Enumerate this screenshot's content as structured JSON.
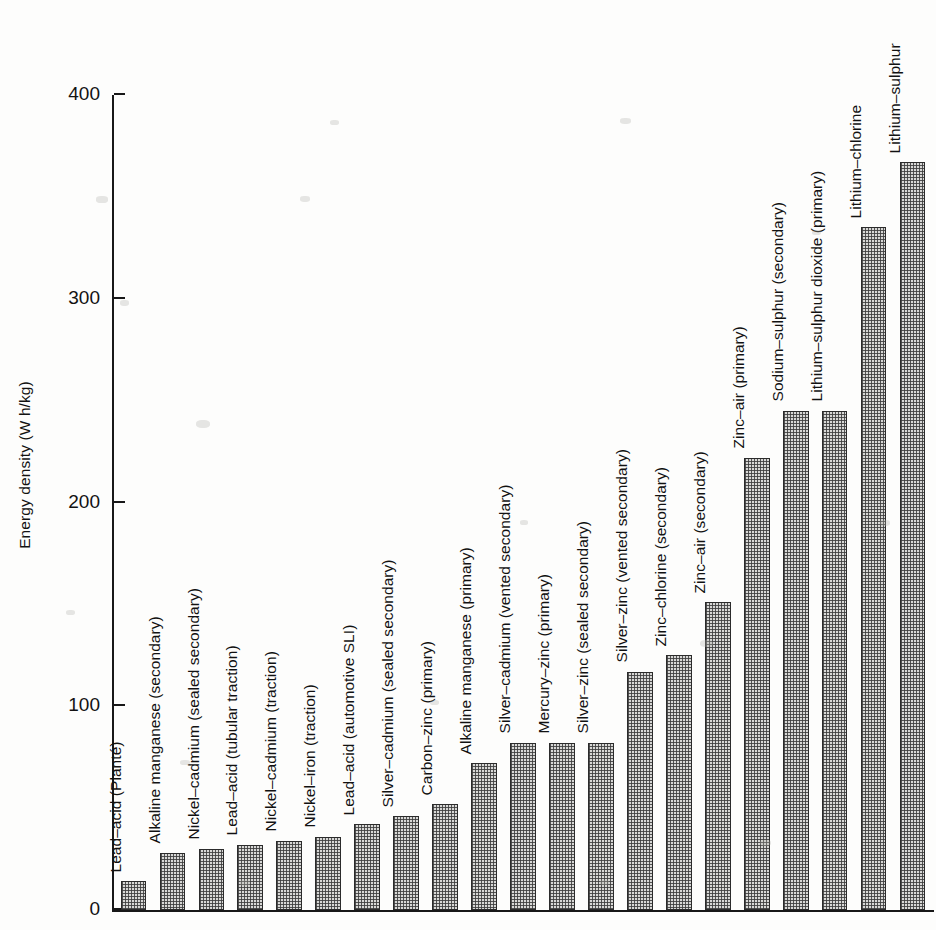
{
  "chart_data": {
    "type": "bar",
    "title": "",
    "xlabel": "",
    "ylabel": "Energy density (W h/kg)",
    "ylim": [
      0,
      400
    ],
    "yticks": [
      0,
      100,
      200,
      300,
      400
    ],
    "ytick_labels": [
      "0",
      "100",
      "200",
      "300",
      "400"
    ],
    "grid": false,
    "legend": "none",
    "categories": [
      "Lead–acid (Planté)",
      "Alkaline manganese (secondary)",
      "Nickel–cadmium (sealed secondary)",
      "Lead–acid (tubular traction)",
      "Nickel–cadmium (traction)",
      "Nickel–iron (traction)",
      "Lead–acid (automotive SLI)",
      "Silver–cadmium (sealed secondary)",
      "Carbon–zinc (primary)",
      "Alkaline manganese (primary)",
      "Silver–cadmium (vented secondary)",
      "Mercury–zinc (primary)",
      "Silver–zinc (sealed secondary)",
      "Silver–zinc (vented secondary)",
      "Zinc–chlorine (secondary)",
      "Zinc–air (secondary)",
      "Zinc–air (primary)",
      "Sodium–sulphur (secondary)",
      "Lithium–sulphur dioxide (primary)",
      "Lithium–chlorine",
      "Lithium–sulphur"
    ],
    "values": [
      14,
      28,
      30,
      32,
      34,
      36,
      42,
      46,
      52,
      72,
      82,
      82,
      82,
      117,
      125,
      151,
      222,
      245,
      245,
      335,
      367
    ]
  }
}
